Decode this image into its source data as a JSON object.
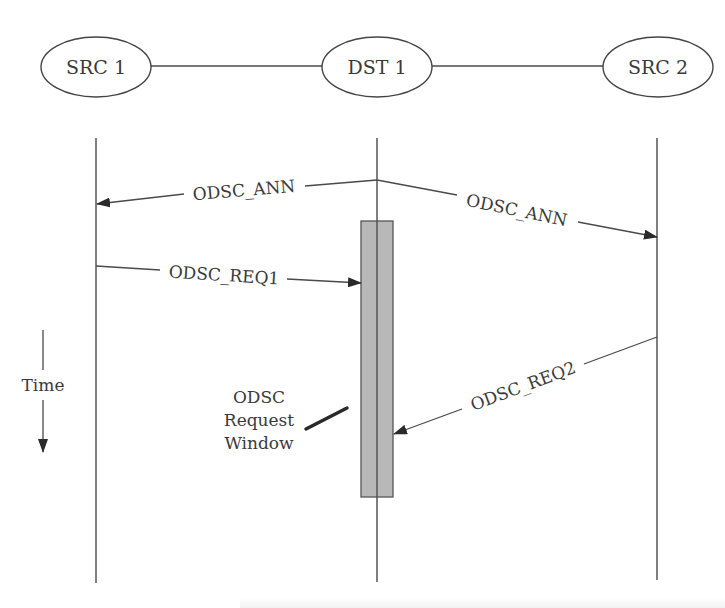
{
  "diagram": {
    "nodes": [
      {
        "id": "src1",
        "label": "SRC 1"
      },
      {
        "id": "dst1",
        "label": "DST 1"
      },
      {
        "id": "src2",
        "label": "SRC 2"
      }
    ],
    "messages": [
      {
        "id": "ann_left",
        "label": "ODSC_ANN",
        "from": "DST 1",
        "to": "SRC 1"
      },
      {
        "id": "ann_right",
        "label": "ODSC_ANN",
        "from": "DST 1",
        "to": "SRC 2"
      },
      {
        "id": "req1",
        "label": "ODSC_REQ1",
        "from": "SRC 1",
        "to": "DST 1"
      },
      {
        "id": "req2",
        "label": "ODSC_REQ2",
        "from": "SRC 2",
        "to": "DST 1"
      }
    ],
    "time_axis": {
      "label": "Time"
    },
    "request_window": {
      "label_lines": [
        "ODSC",
        "Request",
        "Window"
      ],
      "fill_color": "#b8b8b8"
    }
  }
}
